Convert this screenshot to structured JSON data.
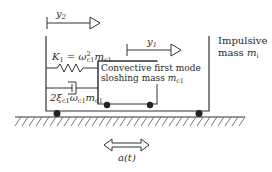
{
  "diagram": {
    "type": "mechanical-model",
    "labels": {
      "y2": "y",
      "y2_sub": "2",
      "y1": "y",
      "y1_sub": "1",
      "k1_lhs": "K",
      "k1_sub": "1",
      "k1_eq": " = ω",
      "k1_omega_sup": "2",
      "k1_omega_sub": "c1",
      "k1_m": "m",
      "k1_m_sub": "c1",
      "damping_coef": "2ξ",
      "damping_xi_sub": "c1",
      "damping_omega": "ω",
      "damping_omega_sub": "c1",
      "damping_m": "m",
      "damping_m_sub": "c1",
      "convective_line1": "Convective first mode",
      "convective_line2": "sloshing mass ",
      "convective_m": "m",
      "convective_m_sub": "c1",
      "impulsive_line1": "Impulsive",
      "impulsive_line2": "mass ",
      "impulsive_m": "m",
      "impulsive_m_sub": "i",
      "excitation": "a(t)"
    },
    "colors": {
      "line": "#333333",
      "wheel": "#222222",
      "background": "#ffffff"
    }
  }
}
